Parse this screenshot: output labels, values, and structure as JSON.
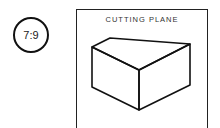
{
  "badge": {
    "label": "7:9"
  },
  "panel": {
    "title": "CUTTING PLANE"
  },
  "figure": {
    "shape": "isometric-cut-block",
    "stroke_color": "#111111"
  }
}
